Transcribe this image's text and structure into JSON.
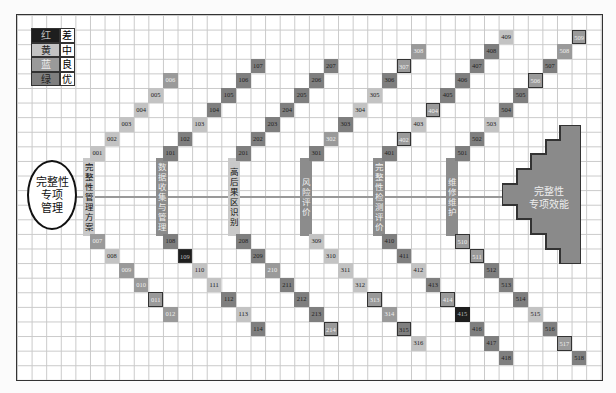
{
  "legend": [
    {
      "color_label": "红",
      "meaning": "差",
      "shade": "bad"
    },
    {
      "color_label": "黄",
      "meaning": "中",
      "shade": "mid"
    },
    {
      "color_label": "蓝",
      "meaning": "良",
      "shade": "good"
    },
    {
      "color_label": "绿",
      "meaning": "优",
      "shade": "exc"
    }
  ],
  "start_node": {
    "lines": [
      "完整性",
      "专项",
      "管理"
    ]
  },
  "end_node": {
    "lines": [
      "完整性",
      "专项效能"
    ]
  },
  "stages": [
    {
      "label": "完整性管理方案",
      "chars": [
        "完",
        "整",
        "性",
        "管",
        "理",
        "方",
        "案"
      ],
      "style": "light"
    },
    {
      "label": "数据收集与管理",
      "chars": [
        "数",
        "据",
        "收",
        "集",
        "与",
        "管",
        "理"
      ],
      "style": "dark"
    },
    {
      "label": "高后果区识别",
      "chars": [
        "高",
        "后",
        "果",
        "区",
        "识",
        "别"
      ],
      "style": "light"
    },
    {
      "label": "风险评价",
      "chars": [
        "风",
        "险",
        "评",
        "价"
      ],
      "style": "dark"
    },
    {
      "label": "完整性检测评价",
      "chars": [
        "完",
        "整",
        "性",
        "检",
        "测",
        "评",
        "价"
      ],
      "style": "dark"
    },
    {
      "label": "维修维护",
      "chars": [
        "维",
        "修",
        "维",
        "护"
      ],
      "style": "dark"
    }
  ],
  "cells": [
    {
      "id": "001",
      "c": 5,
      "r": 9,
      "s": "mid"
    },
    {
      "id": "002",
      "c": 6,
      "r": 8,
      "s": "mid"
    },
    {
      "id": "003",
      "c": 7,
      "r": 7,
      "s": "mid"
    },
    {
      "id": "004",
      "c": 8,
      "r": 6,
      "s": "mid"
    },
    {
      "id": "005",
      "c": 9,
      "r": 5,
      "s": "mid"
    },
    {
      "id": "006",
      "c": 10,
      "r": 4,
      "s": "good"
    },
    {
      "id": "007",
      "c": 5,
      "r": 15,
      "s": "good"
    },
    {
      "id": "008",
      "c": 6,
      "r": 16,
      "s": "mid"
    },
    {
      "id": "009",
      "c": 7,
      "r": 17,
      "s": "good"
    },
    {
      "id": "010",
      "c": 8,
      "r": 18,
      "s": "good"
    },
    {
      "id": "011",
      "c": 9,
      "r": 19,
      "s": "good",
      "box": true
    },
    {
      "id": "012",
      "c": 10,
      "r": 20,
      "s": "good"
    },
    {
      "id": "101",
      "c": 10,
      "r": 9,
      "s": "exc"
    },
    {
      "id": "102",
      "c": 11,
      "r": 8,
      "s": "exc"
    },
    {
      "id": "103",
      "c": 12,
      "r": 7,
      "s": "mid"
    },
    {
      "id": "104",
      "c": 13,
      "r": 6,
      "s": "exc"
    },
    {
      "id": "105",
      "c": 14,
      "r": 5,
      "s": "exc"
    },
    {
      "id": "106",
      "c": 15,
      "r": 4,
      "s": "exc"
    },
    {
      "id": "107",
      "c": 16,
      "r": 3,
      "s": "exc"
    },
    {
      "id": "108",
      "c": 10,
      "r": 15,
      "s": "exc"
    },
    {
      "id": "109",
      "c": 11,
      "r": 16,
      "s": "bad",
      "box": true
    },
    {
      "id": "110",
      "c": 12,
      "r": 17,
      "s": "mid"
    },
    {
      "id": "111",
      "c": 13,
      "r": 18,
      "s": "mid"
    },
    {
      "id": "112",
      "c": 14,
      "r": 19,
      "s": "exc"
    },
    {
      "id": "113",
      "c": 15,
      "r": 20,
      "s": "mid"
    },
    {
      "id": "114",
      "c": 16,
      "r": 21,
      "s": "exc"
    },
    {
      "id": "201",
      "c": 15,
      "r": 9,
      "s": "exc"
    },
    {
      "id": "202",
      "c": 16,
      "r": 8,
      "s": "exc"
    },
    {
      "id": "203",
      "c": 17,
      "r": 7,
      "s": "exc"
    },
    {
      "id": "204",
      "c": 18,
      "r": 6,
      "s": "exc"
    },
    {
      "id": "205",
      "c": 19,
      "r": 5,
      "s": "exc"
    },
    {
      "id": "206",
      "c": 20,
      "r": 4,
      "s": "exc"
    },
    {
      "id": "207",
      "c": 21,
      "r": 3,
      "s": "exc"
    },
    {
      "id": "208",
      "c": 15,
      "r": 15,
      "s": "exc"
    },
    {
      "id": "209",
      "c": 16,
      "r": 16,
      "s": "exc"
    },
    {
      "id": "210",
      "c": 17,
      "r": 17,
      "s": "good"
    },
    {
      "id": "211",
      "c": 18,
      "r": 18,
      "s": "exc"
    },
    {
      "id": "212",
      "c": 19,
      "r": 19,
      "s": "exc"
    },
    {
      "id": "213",
      "c": 20,
      "r": 20,
      "s": "exc"
    },
    {
      "id": "214",
      "c": 21,
      "r": 21,
      "s": "good",
      "box": true
    },
    {
      "id": "301",
      "c": 20,
      "r": 9,
      "s": "exc"
    },
    {
      "id": "302",
      "c": 21,
      "r": 8,
      "s": "good"
    },
    {
      "id": "303",
      "c": 22,
      "r": 7,
      "s": "exc"
    },
    {
      "id": "304",
      "c": 23,
      "r": 6,
      "s": "mid"
    },
    {
      "id": "305",
      "c": 24,
      "r": 5,
      "s": "mid"
    },
    {
      "id": "306",
      "c": 25,
      "r": 4,
      "s": "exc"
    },
    {
      "id": "307",
      "c": 26,
      "r": 3,
      "s": "good",
      "box": true
    },
    {
      "id": "308",
      "c": 27,
      "r": 2,
      "s": "good"
    },
    {
      "id": "309",
      "c": 20,
      "r": 15,
      "s": "mid"
    },
    {
      "id": "310",
      "c": 21,
      "r": 16,
      "s": "mid"
    },
    {
      "id": "311",
      "c": 22,
      "r": 17,
      "s": "mid"
    },
    {
      "id": "312",
      "c": 23,
      "r": 18,
      "s": "mid"
    },
    {
      "id": "313",
      "c": 24,
      "r": 19,
      "s": "good",
      "box": true
    },
    {
      "id": "314",
      "c": 25,
      "r": 20,
      "s": "good"
    },
    {
      "id": "315",
      "c": 26,
      "r": 21,
      "s": "exc",
      "box": true
    },
    {
      "id": "316",
      "c": 27,
      "r": 22,
      "s": "mid"
    },
    {
      "id": "401",
      "c": 25,
      "r": 9,
      "s": "exc"
    },
    {
      "id": "402",
      "c": 26,
      "r": 8,
      "s": "good",
      "box": true
    },
    {
      "id": "403",
      "c": 27,
      "r": 7,
      "s": "mid"
    },
    {
      "id": "404",
      "c": 28,
      "r": 6,
      "s": "good",
      "box": true
    },
    {
      "id": "405",
      "c": 29,
      "r": 5,
      "s": "exc"
    },
    {
      "id": "406",
      "c": 30,
      "r": 4,
      "s": "exc"
    },
    {
      "id": "407",
      "c": 31,
      "r": 3,
      "s": "exc"
    },
    {
      "id": "408",
      "c": 32,
      "r": 2,
      "s": "exc"
    },
    {
      "id": "409",
      "c": 33,
      "r": 1,
      "s": "mid"
    },
    {
      "id": "410",
      "c": 25,
      "r": 15,
      "s": "exc"
    },
    {
      "id": "411",
      "c": 26,
      "r": 16,
      "s": "exc"
    },
    {
      "id": "412",
      "c": 27,
      "r": 17,
      "s": "mid"
    },
    {
      "id": "413",
      "c": 28,
      "r": 18,
      "s": "exc"
    },
    {
      "id": "414",
      "c": 29,
      "r": 19,
      "s": "good",
      "box": true
    },
    {
      "id": "415",
      "c": 30,
      "r": 20,
      "s": "bad"
    },
    {
      "id": "416",
      "c": 31,
      "r": 21,
      "s": "exc"
    },
    {
      "id": "417",
      "c": 32,
      "r": 22,
      "s": "exc"
    },
    {
      "id": "418",
      "c": 33,
      "r": 23,
      "s": "exc"
    },
    {
      "id": "501",
      "c": 30,
      "r": 9,
      "s": "exc"
    },
    {
      "id": "502",
      "c": 31,
      "r": 8,
      "s": "exc"
    },
    {
      "id": "503",
      "c": 32,
      "r": 7,
      "s": "mid"
    },
    {
      "id": "504",
      "c": 33,
      "r": 6,
      "s": "exc"
    },
    {
      "id": "505",
      "c": 34,
      "r": 5,
      "s": "exc"
    },
    {
      "id": "506",
      "c": 35,
      "r": 4,
      "s": "good",
      "box": true
    },
    {
      "id": "507",
      "c": 36,
      "r": 3,
      "s": "exc"
    },
    {
      "id": "508",
      "c": 37,
      "r": 2,
      "s": "good"
    },
    {
      "id": "509",
      "c": 38,
      "r": 1,
      "s": "good",
      "box": true
    },
    {
      "id": "510",
      "c": 30,
      "r": 15,
      "s": "good",
      "box": true
    },
    {
      "id": "511",
      "c": 31,
      "r": 16,
      "s": "good",
      "box": true
    },
    {
      "id": "512",
      "c": 32,
      "r": 17,
      "s": "exc"
    },
    {
      "id": "513",
      "c": 33,
      "r": 18,
      "s": "exc"
    },
    {
      "id": "514",
      "c": 34,
      "r": 19,
      "s": "exc"
    },
    {
      "id": "515",
      "c": 35,
      "r": 20,
      "s": "mid"
    },
    {
      "id": "516",
      "c": 36,
      "r": 21,
      "s": "exc"
    },
    {
      "id": "517",
      "c": 37,
      "r": 22,
      "s": "good",
      "box": true
    },
    {
      "id": "518",
      "c": 38,
      "r": 23,
      "s": "exc"
    }
  ]
}
